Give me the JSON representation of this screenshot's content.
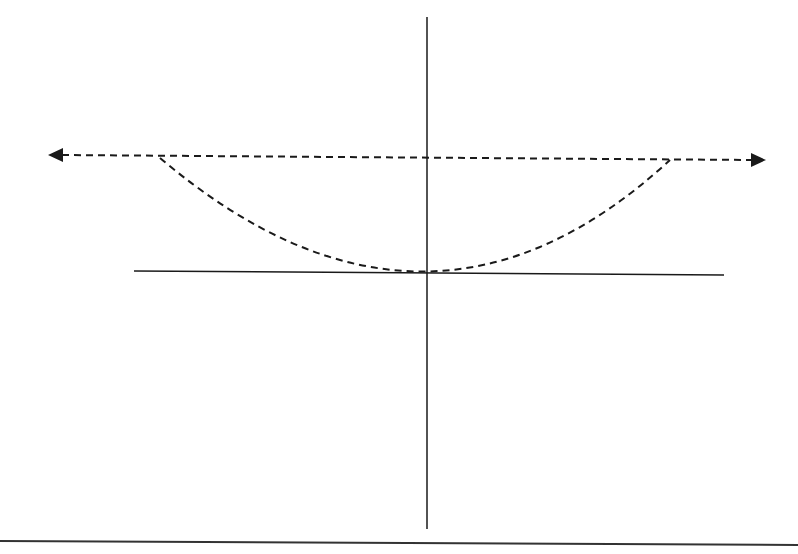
{
  "diagram": {
    "colors": {
      "stroke": "#1a1a1a",
      "background": "#ffffff"
    },
    "elements": {
      "vertical_axis": {
        "x": 427,
        "y1": 17,
        "y2": 529
      },
      "horizontal_line": {
        "x1": 134,
        "y1": 271,
        "x2": 724,
        "y2": 275
      },
      "dashed_arrow": {
        "x1": 48,
        "y1": 155,
        "x2": 766,
        "y2": 160,
        "heads": "both"
      },
      "dashed_curve": {
        "start": [
          160,
          158
        ],
        "vertex": [
          427,
          271
        ],
        "end": [
          670,
          160
        ]
      },
      "bottom_rule": {
        "x1": 0,
        "y1": 541,
        "x2": 798,
        "y2": 545
      }
    }
  }
}
